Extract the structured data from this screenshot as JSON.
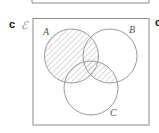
{
  "part_labels": {
    "current": "c",
    "next_partial": "c"
  },
  "universal_set": {
    "symbol": "ℰ"
  },
  "sets": [
    {
      "name": "A",
      "cx": 71.5,
      "cy": 56,
      "r": 27,
      "label_x": 45,
      "label_y": 34
    },
    {
      "name": "B",
      "cx": 110,
      "cy": 56,
      "r": 27,
      "label_x": 131,
      "label_y": 31
    },
    {
      "name": "C",
      "cx": 91,
      "cy": 88,
      "r": 27,
      "label_x": 112,
      "label_y": 114
    }
  ],
  "shaded_region": "A ∪ (B ∩ C)",
  "colors": {
    "outline": "#9a9a9a",
    "box": "#8c8c8c",
    "hatch": "#b8b8b8",
    "background": "#ffffff"
  }
}
